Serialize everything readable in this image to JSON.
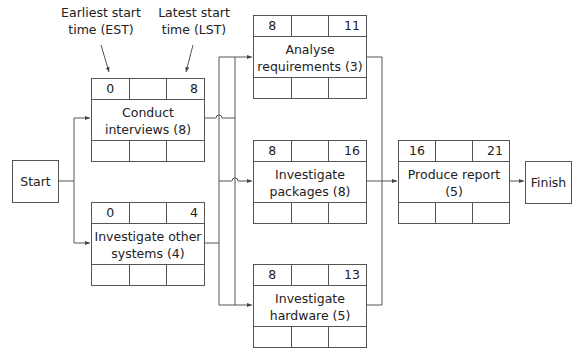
{
  "annotations": {
    "est_label": "Earliest start time (EST)",
    "lst_label": "Latest start time (LST)"
  },
  "start": {
    "label": "Start"
  },
  "finish": {
    "label": "Finish"
  },
  "activities": [
    {
      "id": "conduct_interviews",
      "name": "Conduct interviews (8)",
      "est": "0",
      "lst": "8",
      "duration": 8
    },
    {
      "id": "investigate_other_systems",
      "name": "Investigate other systems (4)",
      "est": "0",
      "lst": "4",
      "duration": 4
    },
    {
      "id": "analyse_requirements",
      "name": "Analyse requirements (3)",
      "est": "8",
      "lst": "11",
      "duration": 3
    },
    {
      "id": "investigate_packages",
      "name": "Investigate packages (8)",
      "est": "8",
      "lst": "16",
      "duration": 8
    },
    {
      "id": "investigate_hardware",
      "name": "Investigate hardware (5)",
      "est": "8",
      "lst": "13",
      "duration": 5
    },
    {
      "id": "produce_report",
      "name": "Produce report (5)",
      "est": "16",
      "lst": "21",
      "duration": 5
    }
  ],
  "edges": [
    {
      "from": "start",
      "to": "conduct_interviews"
    },
    {
      "from": "start",
      "to": "investigate_other_systems"
    },
    {
      "from": "conduct_interviews",
      "to": "analyse_requirements"
    },
    {
      "from": "conduct_interviews",
      "to": "investigate_packages"
    },
    {
      "from": "conduct_interviews",
      "to": "investigate_hardware"
    },
    {
      "from": "investigate_other_systems",
      "to": "analyse_requirements"
    },
    {
      "from": "investigate_other_systems",
      "to": "investigate_packages"
    },
    {
      "from": "investigate_other_systems",
      "to": "investigate_hardware"
    },
    {
      "from": "analyse_requirements",
      "to": "produce_report"
    },
    {
      "from": "investigate_packages",
      "to": "produce_report"
    },
    {
      "from": "investigate_hardware",
      "to": "produce_report"
    },
    {
      "from": "produce_report",
      "to": "finish"
    }
  ],
  "colors": {
    "line": "#555555",
    "text": "#222222",
    "background": "#ffffff"
  }
}
